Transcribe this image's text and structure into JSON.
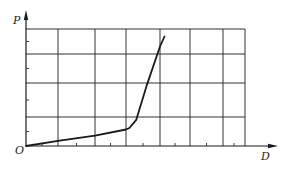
{
  "chart_data": {
    "type": "line",
    "title": "",
    "xlabel": "D",
    "ylabel": "P",
    "origin_label": "O",
    "grid": true,
    "legend": null,
    "x_grid_cols": 7,
    "y_grid_rows": 4,
    "xlim": [
      0,
      7
    ],
    "ylim": [
      0,
      4
    ],
    "series": [
      {
        "name": "P-D curve",
        "description": "Linear low-slope segment from origin to a knee, then steep near-linear rise",
        "x": [
          0,
          1,
          2,
          3,
          3.1,
          3.3,
          3.6,
          4.0,
          4.15
        ],
        "y": [
          0,
          0.18,
          0.36,
          0.57,
          0.62,
          0.9,
          1.9,
          3.3,
          3.7
        ]
      }
    ]
  },
  "labels": {
    "y_axis": "P",
    "x_axis": "D",
    "origin": "O"
  },
  "colors": {
    "line": "#1a1a1a",
    "grid": "#333333",
    "axis": "#1a1a1a"
  }
}
